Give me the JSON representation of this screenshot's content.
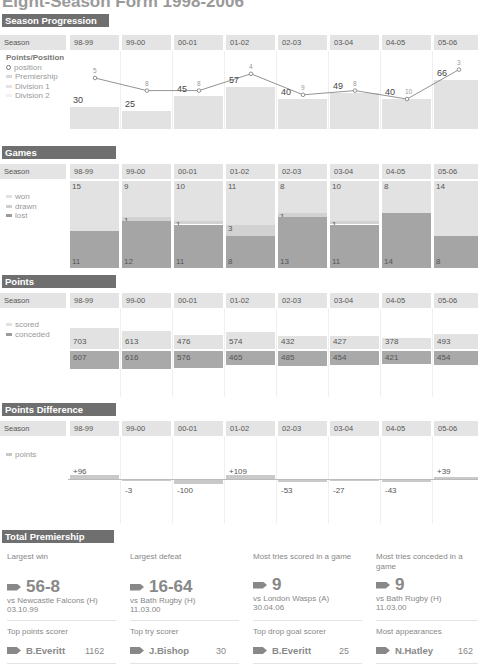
{
  "title": "Eight-Season Form 1998-2006",
  "seasons": [
    "98-99",
    "99-00",
    "00-01",
    "01-02",
    "02-03",
    "03-04",
    "04-05",
    "05-06"
  ],
  "season_label": "Season",
  "sections": {
    "progression": {
      "header": "Season Progression",
      "legend_title": "Points/Position",
      "legend": [
        "position",
        "Premiership",
        "Division 1",
        "Division 2"
      ]
    },
    "games": {
      "header": "Games",
      "legend": [
        "won",
        "drawn",
        "lost"
      ]
    },
    "points": {
      "header": "Points",
      "legend": [
        "scored",
        "conceded"
      ]
    },
    "difference": {
      "header": "Points Difference",
      "legend": [
        "points"
      ]
    },
    "record": {
      "header": "Total Premiership Record"
    }
  },
  "colors": {
    "section_header": "#6f6f6f",
    "season_cell": "#e4e4e4",
    "bar_light": "#e2e2e2",
    "bar_mid": "#d6d6d6",
    "bar_dark": "#a9a9a9",
    "line": "#777777"
  },
  "chart_data": [
    {
      "type": "bar",
      "title": "Season Progression - Points/Position",
      "categories": [
        "98-99",
        "99-00",
        "00-01",
        "01-02",
        "02-03",
        "03-04",
        "04-05",
        "05-06"
      ],
      "series": [
        {
          "name": "league points",
          "values": [
            30,
            25,
            45,
            57,
            40,
            49,
            40,
            66
          ]
        },
        {
          "name": "position",
          "values": [
            5,
            8,
            8,
            4,
            9,
            8,
            10,
            3
          ]
        }
      ]
    },
    {
      "type": "bar",
      "title": "Games",
      "categories": [
        "98-99",
        "99-00",
        "00-01",
        "01-02",
        "02-03",
        "03-04",
        "04-05",
        "05-06"
      ],
      "series": [
        {
          "name": "won",
          "values": [
            15,
            9,
            10,
            11,
            8,
            10,
            8,
            14
          ]
        },
        {
          "name": "drawn",
          "values": [
            0,
            1,
            1,
            3,
            1,
            1,
            0,
            0
          ]
        },
        {
          "name": "lost",
          "values": [
            11,
            12,
            11,
            8,
            13,
            11,
            14,
            8
          ]
        }
      ]
    },
    {
      "type": "bar",
      "title": "Points",
      "categories": [
        "98-99",
        "99-00",
        "00-01",
        "01-02",
        "02-03",
        "03-04",
        "04-05",
        "05-06"
      ],
      "series": [
        {
          "name": "scored",
          "values": [
            703,
            613,
            476,
            574,
            432,
            427,
            378,
            493
          ]
        },
        {
          "name": "conceded",
          "values": [
            607,
            616,
            576,
            465,
            485,
            454,
            421,
            454
          ]
        }
      ]
    },
    {
      "type": "bar",
      "title": "Points Difference",
      "categories": [
        "98-99",
        "99-00",
        "00-01",
        "01-02",
        "02-03",
        "03-04",
        "04-05",
        "05-06"
      ],
      "series": [
        {
          "name": "points",
          "values": [
            96,
            -3,
            -100,
            109,
            -53,
            -27,
            -43,
            39
          ]
        }
      ],
      "labels": [
        "+96",
        "-3",
        "-100",
        "+109",
        "-53",
        "-27",
        "-43",
        "+39"
      ]
    }
  ],
  "progression_labels": {
    "points": [
      "30",
      "25",
      "45",
      "57",
      "40",
      "49",
      "40",
      "66"
    ],
    "positions": [
      "5",
      "8",
      "8",
      "4",
      "9",
      "8",
      "10",
      "3"
    ]
  },
  "games_labels": {
    "won": [
      "15",
      "9",
      "10",
      "11",
      "8",
      "10",
      "8",
      "14"
    ],
    "drawn": [
      "",
      "1",
      "1",
      "3",
      "1",
      "1",
      "",
      ""
    ],
    "lost": [
      "11",
      "12",
      "11",
      "8",
      "13",
      "11",
      "14",
      "8"
    ]
  },
  "points_labels": {
    "scored": [
      "703",
      "613",
      "476",
      "574",
      "432",
      "427",
      "378",
      "493"
    ],
    "conceded": [
      "607",
      "616",
      "576",
      "465",
      "485",
      "454",
      "421",
      "454"
    ]
  },
  "difference_labels": [
    "+96",
    "-3",
    "-100",
    "+109",
    "-53",
    "-27",
    "-43",
    "+39"
  ],
  "record": {
    "cards": [
      {
        "label": "Largest win",
        "score": "56-8",
        "opponent": "vs  Newcastle Falcons (H)",
        "date": "03.10.99"
      },
      {
        "label": "Largest defeat",
        "score": "16-64",
        "opponent": "vs  Bath Rugby (H)",
        "date": "11.03.00"
      },
      {
        "label": "Most tries scored in a game",
        "score": "9",
        "opponent": "vs  London Wasps (A)",
        "date": "30.04.06"
      },
      {
        "label": "Most tries conceded in a game",
        "score": "9",
        "opponent": "vs  Bath Rugby (H)",
        "date": "11.03.00"
      }
    ],
    "scorers": [
      {
        "label": "Top points scorer",
        "name": "B.Everitt",
        "value": "1162"
      },
      {
        "label": "Top try scorer",
        "name": "J.Bishop",
        "value": "30"
      },
      {
        "label": "Top drop goal scorer",
        "name": "B.Everitt",
        "value": "25"
      },
      {
        "label": "Most appearances",
        "name": "N.Hatley",
        "value": "162"
      }
    ]
  }
}
